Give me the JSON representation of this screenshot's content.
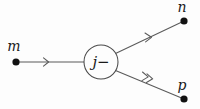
{
  "figure": {
    "background_color": "#fdfdfd",
    "line_color": "#5a5a5a",
    "dot_color": "#111111",
    "label_color": "#1a1a1a"
  },
  "center_node": {
    "label": "j−",
    "shape": "circle",
    "cx": 101,
    "cy": 62,
    "r": 17
  },
  "vertices": [
    {
      "id": "m",
      "label": "m",
      "x": 16,
      "y": 62,
      "label_x": 14,
      "label_y": 50,
      "role": "source"
    },
    {
      "id": "n",
      "label": "n",
      "x": 184,
      "y": 21,
      "label_x": 182,
      "label_y": 11,
      "role": "target"
    },
    {
      "id": "p",
      "label": "p",
      "x": 184,
      "y": 99,
      "label_x": 182,
      "label_y": 88,
      "role": "target"
    }
  ],
  "edges": [
    {
      "id": "m-to-j",
      "from": "m",
      "to": "j−",
      "x1": 16,
      "y1": 62,
      "x2": 84,
      "y2": 62,
      "arrow_style": "single",
      "arrow_position": 0.46,
      "direction": "rightward"
    },
    {
      "id": "j-to-n",
      "from": "j−",
      "to": "n",
      "x1": 116,
      "y1": 53,
      "x2": 184,
      "y2": 21,
      "arrow_style": "single",
      "arrow_position": 0.5,
      "direction": "up-right"
    },
    {
      "id": "j-to-p",
      "from": "j−",
      "to": "p",
      "x1": 116,
      "y1": 71,
      "x2": 184,
      "y2": 99,
      "arrow_style": "double",
      "arrow_position": 0.5,
      "direction": "down-right"
    }
  ]
}
